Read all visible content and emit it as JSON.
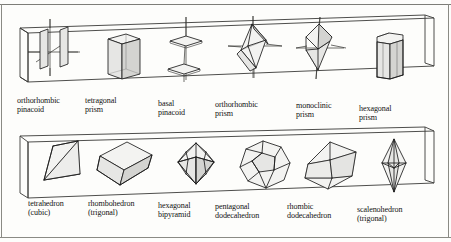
{
  "figure": {
    "panels": [
      {
        "name": "upper-panel",
        "items": [
          {
            "id": "orthorhombic-pinacoid",
            "label": "orthorhombic\npinacoid",
            "label_line1": "orthorhombic",
            "label_line2": "pinacoid",
            "shape": "two-parallel-vertical-planes-with-axes"
          },
          {
            "id": "tetragonal-prism",
            "label": "tetragonal\nprism",
            "label_line1": "tetragonal",
            "label_line2": "prism",
            "shape": "square-prism"
          },
          {
            "id": "basal-pinacoid",
            "label": "basal\npinacoid",
            "label_line1": "basal",
            "label_line2": "pinacoid",
            "shape": "two-parallel-horizontal-planes-with-vertical-axis"
          },
          {
            "id": "orthorhombic-prism",
            "label": "orthorhombic\nprism",
            "label_line1": "orthorhombic",
            "label_line2": "prism",
            "shape": "orthorhombic-dipyramid-with-axes"
          },
          {
            "id": "monoclinic-prism",
            "label": "monoclinic\nprism",
            "label_line1": "monoclinic",
            "label_line2": "prism",
            "shape": "sheared-rhombic-solid-with-axes"
          },
          {
            "id": "hexagonal-prism",
            "label": "hexagonal\nprism",
            "label_line1": "hexagonal",
            "label_line2": "prism",
            "shape": "hexagonal-prism"
          }
        ]
      },
      {
        "name": "lower-panel",
        "items": [
          {
            "id": "tetrahedron-cubic",
            "label": "tetrahedron\n(cubic)",
            "label_line1": "tetrahedron",
            "label_line2": "(cubic)",
            "shape": "tetrahedron"
          },
          {
            "id": "rhombohedron-trigonal",
            "label": "rhombohedron\n(trigonal)",
            "label_line1": "rhombohedron",
            "label_line2": "(trigonal)",
            "shape": "rhombohedron"
          },
          {
            "id": "hexagonal-bipyramid",
            "label": "hexagonal\nbipyramid",
            "label_line1": "hexagonal",
            "label_line2": "bipyramid",
            "shape": "hexagonal-bipyramid"
          },
          {
            "id": "pentagonal-dodecahedron",
            "label": "pentagonal\ndodecahedron",
            "label_line1": "pentagonal",
            "label_line2": "dodecahedron",
            "shape": "pentagonal-dodecahedron"
          },
          {
            "id": "rhombic-dodecahedron",
            "label": "rhombic\ndodecahedron",
            "label_line1": "rhombic",
            "label_line2": "dodecahedron",
            "shape": "rhombic-dodecahedron"
          },
          {
            "id": "scalenohedron-trigonal",
            "label": "scalenohedron\n(trigonal)",
            "label_line1": "scalenohedron",
            "label_line2": "(trigonal)",
            "shape": "scalenohedron"
          }
        ]
      }
    ],
    "colors": {
      "ink": "#1a1a1a",
      "face_light": "#f2f2f0",
      "face_mid": "#e4e4e2",
      "face_dark": "#d2d2cf",
      "page": "#fdfdfb",
      "border": "#8a8a84"
    }
  }
}
